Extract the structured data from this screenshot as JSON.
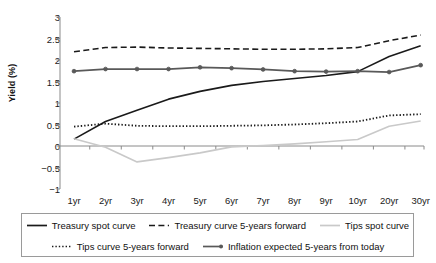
{
  "chart_data": {
    "type": "line",
    "title": "",
    "xlabel": "",
    "ylabel": "Yield (%)",
    "categories": [
      "1yr",
      "2yr",
      "3yr",
      "4yr",
      "5yr",
      "6yr",
      "7yr",
      "8yr",
      "9yr",
      "10yr",
      "20yr",
      "30yr"
    ],
    "ylim": [
      -1,
      3
    ],
    "yticks": [
      3,
      2.5,
      2,
      1.5,
      1,
      0.5,
      0,
      -0.5,
      -1
    ],
    "ytick_labels": [
      "3",
      "2.5",
      "2",
      "1.5",
      "1",
      "0.5",
      "0",
      "−0.5",
      "−1"
    ],
    "grid": false,
    "legend_position": "bottom",
    "series": [
      {
        "name": "Treasury spot curve",
        "style": "solid",
        "color": "#1a1a1a",
        "width": 1.6,
        "markers": false,
        "values": [
          0.16,
          0.57,
          0.83,
          1.09,
          1.27,
          1.41,
          1.5,
          1.57,
          1.64,
          1.73,
          2.08,
          2.33
        ]
      },
      {
        "name": "Treasury curve 5-years forward",
        "style": "dashed",
        "color": "#1a1a1a",
        "width": 1.6,
        "markers": false,
        "values": [
          2.19,
          2.29,
          2.3,
          2.28,
          2.27,
          2.26,
          2.25,
          2.25,
          2.26,
          2.29,
          2.45,
          2.58
        ]
      },
      {
        "name": "Tips spot curve",
        "style": "solid",
        "color": "#c9c9c9",
        "width": 1.6,
        "markers": false,
        "values": [
          0.17,
          -0.03,
          -0.37,
          -0.27,
          -0.16,
          -0.02,
          0.01,
          0.05,
          0.1,
          0.15,
          0.46,
          0.58
        ]
      },
      {
        "name": "Tips curve 5-years forward",
        "style": "dotted",
        "color": "#1a1a1a",
        "width": 1.8,
        "markers": false,
        "values": [
          0.45,
          0.52,
          0.47,
          0.46,
          0.46,
          0.47,
          0.48,
          0.5,
          0.53,
          0.57,
          0.71,
          0.74
        ]
      },
      {
        "name": "Inflation expected 5-years from today",
        "style": "solid",
        "color": "#595959",
        "width": 1.8,
        "markers": true,
        "values": [
          1.74,
          1.79,
          1.79,
          1.79,
          1.83,
          1.81,
          1.78,
          1.74,
          1.73,
          1.74,
          1.72,
          1.88
        ]
      }
    ]
  },
  "axis": {
    "y_title": "Yield (%)"
  },
  "legend": {
    "rows": [
      [
        {
          "label": "Treasury spot curve",
          "style": "solid",
          "color": "#1a1a1a",
          "marker": false
        },
        {
          "label": "Treasury curve 5-years forward",
          "style": "dashed",
          "color": "#1a1a1a",
          "marker": false
        },
        {
          "label": "Tips spot curve",
          "style": "solid",
          "color": "#c9c9c9",
          "marker": false
        }
      ],
      [
        {
          "label": "Tips curve 5-years forward",
          "style": "dotted",
          "color": "#1a1a1a",
          "marker": false
        },
        {
          "label": "Inflation expected 5-years from today",
          "style": "solid",
          "color": "#595959",
          "marker": true
        }
      ]
    ]
  }
}
